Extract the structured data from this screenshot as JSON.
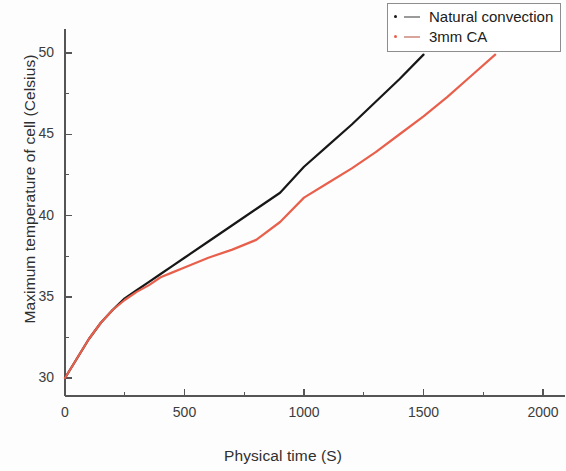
{
  "chart_data": {
    "type": "line",
    "title": "",
    "xlabel": "Physical time (S)",
    "ylabel": "Maximum temperature of cell (Celsius)",
    "xlim": [
      0,
      2100
    ],
    "ylim": [
      28.5,
      51.5
    ],
    "xticks": [
      0,
      500,
      1000,
      1500,
      2000
    ],
    "xtick_labels": [
      "0",
      "500",
      "1000",
      "1500",
      "2000"
    ],
    "yticks": [
      30,
      35,
      40,
      45,
      50
    ],
    "ytick_labels": [
      "30",
      "35",
      "40",
      "45",
      "50"
    ],
    "xminor_ticks": [
      250,
      750,
      1250,
      1750
    ],
    "yminor_ticks": [
      32.5,
      37.5,
      42.5,
      47.5
    ],
    "grid": false,
    "legend_position": "top-right",
    "colors": {
      "natural_convection": "#171717",
      "3mm_ca": "#e8604c",
      "axis": "#555555",
      "text": "#2f2f2f",
      "legend_border": "#8d8d8d",
      "background": "#fdfdfd"
    },
    "series": [
      {
        "name": "Natural convection",
        "color": "#171717",
        "marker": "dot-dash",
        "x": [
          0,
          50,
          100,
          150,
          200,
          250,
          300,
          350,
          400,
          450,
          500,
          600,
          700,
          800,
          900,
          1000,
          1100,
          1200,
          1300,
          1400,
          1500
        ],
        "y": [
          30.0,
          31.2,
          32.4,
          33.4,
          34.2,
          34.9,
          35.4,
          35.9,
          36.4,
          36.9,
          37.4,
          38.4,
          39.4,
          40.4,
          41.4,
          43.0,
          44.3,
          45.6,
          47.0,
          48.4,
          49.9
        ]
      },
      {
        "name": "3mm CA",
        "color": "#e8604c",
        "marker": "dot-dash",
        "x": [
          0,
          50,
          100,
          150,
          200,
          250,
          300,
          350,
          400,
          450,
          500,
          600,
          700,
          800,
          900,
          1000,
          1100,
          1200,
          1300,
          1400,
          1500,
          1600,
          1700,
          1800
        ],
        "y": [
          30.0,
          31.2,
          32.4,
          33.4,
          34.2,
          34.8,
          35.3,
          35.7,
          36.2,
          36.5,
          36.8,
          37.4,
          37.9,
          38.5,
          39.6,
          41.1,
          42.0,
          42.9,
          43.9,
          45.0,
          46.1,
          47.3,
          48.6,
          49.9
        ]
      }
    ]
  },
  "legend": {
    "items": [
      {
        "label": "Natural convection",
        "color": "#171717"
      },
      {
        "label": "3mm CA",
        "color": "#e8604c"
      }
    ]
  }
}
